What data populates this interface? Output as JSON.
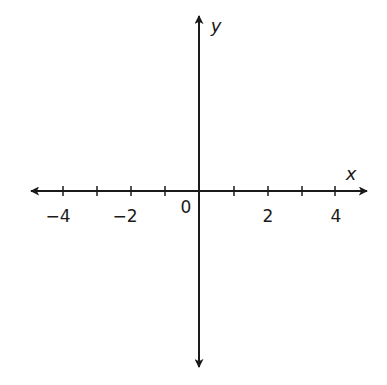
{
  "diagram": {
    "type": "coordinate-plane-axes",
    "axes": {
      "x": {
        "label": "x",
        "tick_min": -4,
        "tick_max": 4,
        "tick_step": 1,
        "arrows": "both"
      },
      "y": {
        "label": "y",
        "arrows": "both"
      }
    },
    "origin_label": "0",
    "x_tick_labels": [
      {
        "value": -4,
        "text": "−4"
      },
      {
        "value": -2,
        "text": "−2"
      },
      {
        "value": 2,
        "text": "2"
      },
      {
        "value": 4,
        "text": "4"
      }
    ],
    "colors": {
      "background": "#ffffff",
      "axis": "#1a1a1a",
      "text": "#1a1a1a"
    }
  }
}
